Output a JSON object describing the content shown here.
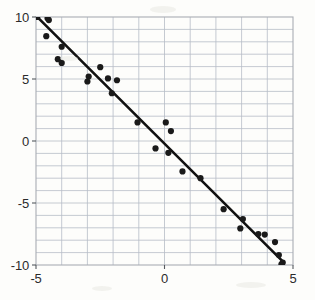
{
  "chart_data": {
    "type": "scatter",
    "title": "",
    "subtitle": "",
    "xlabel": "",
    "ylabel": "",
    "xlim": [
      -5,
      5
    ],
    "ylim": [
      -10,
      10
    ],
    "grid": true,
    "grid_x_step": 1,
    "grid_y_step": 1,
    "legend": "none",
    "annotations": [],
    "xticks": [
      -5,
      0,
      5
    ],
    "xtick_labels": [
      "-5",
      "0",
      "5"
    ],
    "yticks": [
      10,
      5,
      0,
      -5,
      -10
    ],
    "ytick_labels": [
      "10",
      "5",
      "0",
      "-5",
      "-10"
    ],
    "series": [
      {
        "name": "observations",
        "type": "scatter",
        "marker": "circle",
        "color": "#1a1a1a",
        "points": [
          [
            -4.95,
            10.0
          ],
          [
            -4.55,
            9.9
          ],
          [
            -4.5,
            9.75
          ],
          [
            -4.6,
            8.45
          ],
          [
            -4.0,
            7.6
          ],
          [
            -4.15,
            6.6
          ],
          [
            -4.0,
            6.3
          ],
          [
            -2.95,
            5.2
          ],
          [
            -3.0,
            4.8
          ],
          [
            -2.5,
            5.95
          ],
          [
            -2.2,
            5.05
          ],
          [
            -1.85,
            4.9
          ],
          [
            -2.05,
            3.85
          ],
          [
            -1.05,
            1.5
          ],
          [
            0.05,
            1.5
          ],
          [
            0.25,
            0.8
          ],
          [
            -0.35,
            -0.6
          ],
          [
            0.15,
            -0.95
          ],
          [
            0.7,
            -2.45
          ],
          [
            1.4,
            -3.0
          ],
          [
            2.3,
            -5.5
          ],
          [
            2.95,
            -7.05
          ],
          [
            3.05,
            -6.3
          ],
          [
            3.65,
            -7.5
          ],
          [
            3.9,
            -7.55
          ],
          [
            4.3,
            -8.15
          ],
          [
            4.45,
            -9.2
          ],
          [
            4.6,
            -9.8
          ],
          [
            4.55,
            -9.95
          ]
        ]
      },
      {
        "name": "fit-line",
        "type": "line",
        "color": "#111111",
        "slope": -2.05,
        "intercept": -0.15,
        "x_start": -5.0,
        "y_start": 10.1,
        "x_end": 4.62,
        "y_end": -9.75
      }
    ]
  }
}
